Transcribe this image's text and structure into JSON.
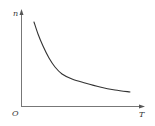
{
  "chart_data": {
    "type": "line",
    "title": "",
    "xlabel": "T",
    "ylabel": "n",
    "origin_label": "O",
    "grid": false,
    "legend": null,
    "ticks": {
      "x": [],
      "y": []
    },
    "series": [
      {
        "name": "n vs T",
        "description": "monotonically decreasing, convex curve (inverse-like relationship)",
        "points_px": [
          [
            34,
            22
          ],
          [
            38,
            34
          ],
          [
            43,
            46
          ],
          [
            49,
            58
          ],
          [
            55,
            67
          ],
          [
            62,
            74
          ],
          [
            72,
            79
          ],
          [
            85,
            83
          ],
          [
            100,
            87
          ],
          [
            115,
            90
          ],
          [
            130,
            92
          ]
        ]
      }
    ],
    "colors": {
      "axis": "#777777",
      "curve": "#333333",
      "label": "#333333"
    }
  },
  "labels": {
    "y_axis": "n",
    "x_axis": "T",
    "origin": "O"
  }
}
